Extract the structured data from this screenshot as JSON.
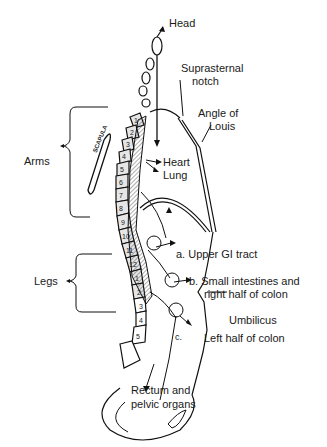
{
  "figure": {
    "labels": {
      "head": "Head",
      "suprasternal_notch_1": "Suprasternal",
      "suprasternal_notch_2": "notch",
      "angle_of_louis_1": "Angle of",
      "angle_of_louis_2": "Louis",
      "heart": "Heart",
      "lung": "Lung",
      "arms": "Arms",
      "legs": "Legs",
      "scapula": "SCAPULA",
      "upper_gi": "a. Upper GI tract",
      "small_intestines_1": "b. Small intestines and",
      "small_intestines_2": "right half of colon",
      "umbilicus": "Umbilicus",
      "c_marker": "c.",
      "left_colon": "Left half of colon",
      "rectum_1": "Rectum and",
      "rectum_2": "pelvic organs"
    },
    "vertebrae": {
      "thoracic": [
        "1",
        "2",
        "3",
        "4",
        "5",
        "6",
        "7",
        "8",
        "9",
        "10",
        "11",
        "12"
      ],
      "lumbar": [
        "1",
        "2",
        "3",
        "4",
        "5"
      ]
    }
  }
}
